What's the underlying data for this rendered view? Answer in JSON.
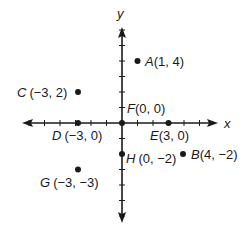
{
  "diagram": {
    "type": "coordinate-plane",
    "axes": {
      "x_label": "x",
      "y_label": "y",
      "x_range": [
        -6,
        6
      ],
      "y_range": [
        -6,
        6
      ],
      "tick_step": 1
    },
    "points": [
      {
        "name": "A",
        "coords": "(1, 4)",
        "x": 1,
        "y": 4
      },
      {
        "name": "B",
        "coords": "(4, −2)",
        "x": 4,
        "y": -2
      },
      {
        "name": "C",
        "coords": "(−3, 2)",
        "x": -3,
        "y": 2
      },
      {
        "name": "D",
        "coords": "(−3, 0)",
        "x": -3,
        "y": 0
      },
      {
        "name": "E",
        "coords": "(3, 0)",
        "x": 3,
        "y": 0
      },
      {
        "name": "F",
        "coords": "(0, 0)",
        "x": 0,
        "y": 0
      },
      {
        "name": "G",
        "coords": "(−3, −3)",
        "x": -3,
        "y": -3
      },
      {
        "name": "H",
        "coords": "(0, −2)",
        "x": 0,
        "y": -2
      }
    ],
    "colors": {
      "ink": "#1a1a1a",
      "background": "#ffffff"
    }
  }
}
